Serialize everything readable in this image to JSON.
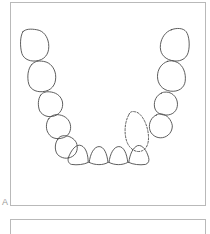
{
  "figure": {
    "panels": [
      {
        "id": "A",
        "label": "A",
        "description": "Mandibular arch outline with individual tooth contours; one tooth rendered with a dashed contour."
      },
      {
        "id": "B",
        "label": "",
        "description": "Second panel, partially visible at the bottom edge; empty."
      }
    ]
  },
  "colors": {
    "background": "#ffffff",
    "panel_border": "#b9b9b9",
    "tooth_stroke": "#4a4a4a",
    "label_text": "#9a9a9a"
  },
  "arch": {
    "jaw": "mandible",
    "view": "occlusal",
    "tooth_count_solid": 14,
    "tooth_count_dashed": 1,
    "dashed_tooth_meaning": "missing-or-planned-tooth",
    "teeth": [
      {
        "index": 1,
        "side": "left",
        "type": "molar",
        "style": "solid",
        "path": "M22 31 C19 36 19 46 21 53 C23 59 30 62 38 60 C46 58 49 51 48 43 C47 36 43 30 36 29 C30 28 25 28 22 31 Z"
      },
      {
        "index": 2,
        "side": "left",
        "type": "molar",
        "style": "solid",
        "path": "M31 64 C27 68 26 77 28 84 C30 90 37 93 45 91 C53 89 56 82 55 74 C54 68 50 62 43 61 C37 60 34 61 31 64 Z"
      },
      {
        "index": 3,
        "side": "left",
        "type": "premolar",
        "style": "solid",
        "path": "M40 95 C37 99 37 106 39 111 C42 116 48 118 54 116 C60 114 63 108 62 102 C61 97 57 93 51 92 C46 91 42 92 40 95 Z"
      },
      {
        "index": 4,
        "side": "left",
        "type": "premolar",
        "style": "solid",
        "path": "M48 119 C45 123 45 130 48 134 C51 139 57 140 63 138 C69 136 71 130 70 125 C69 120 65 116 59 115 C54 114 50 116 48 119 Z"
      },
      {
        "index": 5,
        "side": "left",
        "type": "canine",
        "style": "solid",
        "path": "M57 140 C54 144 54 151 57 155 C61 159 67 160 72 157 C77 154 78 148 76 143 C74 139 69 136 64 136 C61 136 58 137 57 140 Z"
      },
      {
        "index": 6,
        "side": "left",
        "type": "lateral-incisor",
        "style": "solid",
        "path": "M68 158 C71 150 76 144 81 146 C86 148 88 156 88 163 C84 165 77 166 71 165 C68 164 67 161 68 158 Z"
      },
      {
        "index": 7,
        "side": "left",
        "type": "central-incisor",
        "style": "solid",
        "path": "M89 163 C90 154 94 147 99 147 C104 147 107 154 108 163 C103 166 95 166 89 163 Z"
      },
      {
        "index": 8,
        "side": "right",
        "type": "central-incisor",
        "style": "solid",
        "path": "M109 163 C110 154 114 147 119 147 C124 147 127 154 128 163 C122 166 115 166 109 163 Z"
      },
      {
        "index": 9,
        "side": "right",
        "type": "lateral-incisor",
        "style": "solid",
        "path": "M129 163 C130 155 133 148 138 146 C143 145 147 151 149 158 C150 161 149 164 146 165 C140 166 133 165 129 163 Z"
      },
      {
        "index": 10,
        "side": "right",
        "type": "canine",
        "style": "dashed",
        "path": "M129 115 C125 122 124 133 127 142 C130 150 137 154 143 151 C149 148 150 139 148 130 C146 121 141 113 136 112 C132 111 130 112 129 115 Z"
      },
      {
        "index": 11,
        "side": "right",
        "type": "premolar",
        "style": "solid",
        "path": "M157 115 C152 117 149 123 150 129 C151 135 157 139 163 138 C169 137 173 132 173 126 C172 120 168 115 162 114 C160 114 158 114 157 115 Z"
      },
      {
        "index": 12,
        "side": "right",
        "type": "premolar",
        "style": "solid",
        "path": "M162 93 C157 95 154 101 155 107 C156 113 162 116 169 115 C176 114 179 108 178 102 C177 96 172 92 167 92 C165 92 163 92 162 93 Z"
      },
      {
        "index": 13,
        "side": "right",
        "type": "molar",
        "style": "solid",
        "path": "M168 61 C162 63 158 69 158 76 C158 84 163 90 171 91 C179 92 185 88 186 81 C187 73 184 65 178 62 C174 60 171 60 168 61 Z"
      },
      {
        "index": 14,
        "side": "right",
        "type": "molar",
        "style": "solid",
        "path": "M172 29 C166 31 162 37 161 44 C160 52 164 58 172 60 C180 62 187 59 189 52 C191 45 190 35 187 31 C184 27 177 27 172 29 Z"
      }
    ]
  }
}
